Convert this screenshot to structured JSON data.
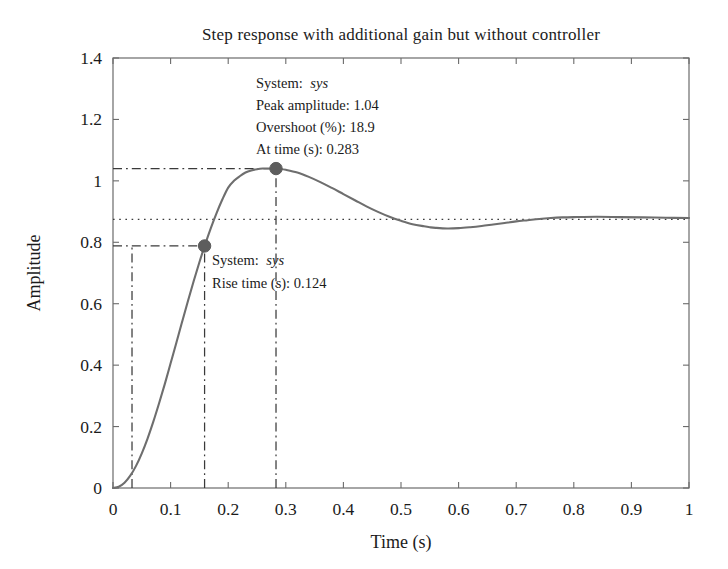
{
  "figure": {
    "title": "Step response with additional gain but without controller",
    "background_color": "#ffffff",
    "plot_border_color": "#6b6b6b",
    "curve_color": "#6e6e6e",
    "marker_color": "#5d5d5d",
    "guide_color": "#3a3a3a",
    "steady_line_color": "#3a3a3a"
  },
  "axes": {
    "x": {
      "label": "Time (s)",
      "min": 0,
      "max": 1,
      "tick_values": [
        0,
        0.1,
        0.2,
        0.3,
        0.4,
        0.5,
        0.6,
        0.7,
        0.8,
        0.9,
        1
      ],
      "tick_labels": [
        "0",
        "0.1",
        "0.2",
        "0.3",
        "0.4",
        "0.5",
        "0.6",
        "0.7",
        "0.8",
        "0.9",
        "1"
      ]
    },
    "y": {
      "label": "Amplitude",
      "min": 0,
      "max": 1.4,
      "tick_values": [
        0,
        0.2,
        0.4,
        0.6,
        0.8,
        1,
        1.2,
        1.4
      ],
      "tick_labels": [
        "0",
        "0.2",
        "0.4",
        "0.6",
        "0.8",
        "1",
        "1.2",
        "1.4"
      ]
    }
  },
  "annotations": {
    "peak": {
      "lines": [
        "System: ",
        "sys",
        "Peak amplitude: 1.04",
        "Overshoot (%): 18.9",
        "At time (s): 0.283"
      ],
      "system_label": "System:",
      "system_value": "sys",
      "peak_amplitude_label": "Peak amplitude: 1.04",
      "overshoot_label": "Overshoot (%): 18.9",
      "at_time_label": "At time (s): 0.283",
      "marker_x": 0.283,
      "marker_y": 1.04
    },
    "rise": {
      "system_label": "System:",
      "system_value": "sys",
      "rise_time_label": "Rise time (s): 0.124",
      "marker_x": 0.159,
      "marker_y": 0.788
    }
  },
  "chart_data": {
    "type": "line",
    "title": "Step response with additional gain but without controller",
    "xlabel": "Time (s)",
    "ylabel": "Amplitude",
    "xlim": [
      0,
      1
    ],
    "ylim": [
      0,
      1.4
    ],
    "grid": false,
    "legend": "none",
    "series": [
      {
        "name": "sys",
        "x": [
          0,
          0.01,
          0.02,
          0.03,
          0.04,
          0.05,
          0.06,
          0.07,
          0.08,
          0.09,
          0.1,
          0.11,
          0.12,
          0.13,
          0.14,
          0.15,
          0.16,
          0.17,
          0.18,
          0.19,
          0.2,
          0.21,
          0.22,
          0.23,
          0.24,
          0.25,
          0.26,
          0.27,
          0.28,
          0.283,
          0.29,
          0.3,
          0.32,
          0.34,
          0.36,
          0.38,
          0.4,
          0.42,
          0.44,
          0.46,
          0.48,
          0.5,
          0.52,
          0.54,
          0.55,
          0.56,
          0.58,
          0.6,
          0.62,
          0.64,
          0.66,
          0.68,
          0.7,
          0.72,
          0.74,
          0.76,
          0.78,
          0.8,
          0.84,
          0.88,
          0.92,
          0.96,
          1
        ],
        "y": [
          0,
          0.004,
          0.017,
          0.04,
          0.072,
          0.113,
          0.161,
          0.216,
          0.276,
          0.339,
          0.406,
          0.473,
          0.541,
          0.608,
          0.673,
          0.735,
          0.793,
          0.847,
          0.896,
          0.94,
          0.978,
          1.0,
          1.015,
          1.027,
          1.034,
          1.038,
          1.04,
          1.04,
          1.04,
          1.04,
          1.039,
          1.036,
          1.027,
          1.013,
          0.996,
          0.977,
          0.957,
          0.937,
          0.917,
          0.899,
          0.883,
          0.87,
          0.859,
          0.852,
          0.849,
          0.847,
          0.845,
          0.846,
          0.849,
          0.853,
          0.858,
          0.863,
          0.868,
          0.872,
          0.876,
          0.879,
          0.881,
          0.882,
          0.883,
          0.882,
          0.881,
          0.88,
          0.879
        ]
      }
    ],
    "reference_lines": [
      {
        "name": "steady-state",
        "orientation": "horizontal",
        "value": 0.875,
        "style": "dotted"
      },
      {
        "name": "peak-amplitude",
        "orientation": "horizontal",
        "value": 1.04,
        "style": "dash-dot"
      },
      {
        "name": "rise-start",
        "orientation": "vertical",
        "value": 0.033,
        "style": "dash-dot"
      },
      {
        "name": "rise-end",
        "orientation": "vertical",
        "value": 0.159,
        "style": "dash-dot"
      },
      {
        "name": "peak-time",
        "orientation": "vertical",
        "value": 0.283,
        "style": "dash-dot"
      }
    ],
    "markers": [
      {
        "name": "peak-marker",
        "x": 0.283,
        "y": 1.04
      },
      {
        "name": "rise-time-marker",
        "x": 0.159,
        "y": 0.788
      }
    ]
  }
}
